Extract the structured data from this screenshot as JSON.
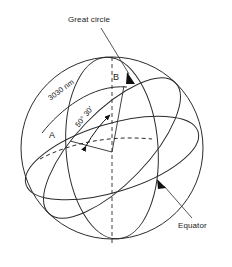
{
  "figure": {
    "type": "geometry-diagram",
    "stroke_color": "#2b2b2b",
    "background_color": "#ffffff",
    "labels": {
      "great_circle": "Great circle",
      "equator": "Equator",
      "point_a": "A",
      "point_b": "B",
      "distance": "3030 nm",
      "angle": "50° 30'"
    },
    "annotations": [
      {
        "name": "great-circle-leader",
        "text": "Great circle",
        "points_to": "great-circle-arc"
      },
      {
        "name": "equator-leader",
        "text": "Equator",
        "points_to": "equator-ellipse"
      },
      {
        "name": "arc-distance",
        "text": "3030 nm",
        "along": "great-circle-arc-A-to-B"
      },
      {
        "name": "central-angle",
        "text": "50° 30'",
        "between": "radius-A and radius-B"
      }
    ],
    "geometry": {
      "sphere_center": [
        112,
        148
      ],
      "sphere_radius": 91,
      "point_a": [
        70,
        140
      ],
      "point_b": [
        127,
        89
      ],
      "polar_axis": "vertical dashed line through sphere center"
    }
  }
}
